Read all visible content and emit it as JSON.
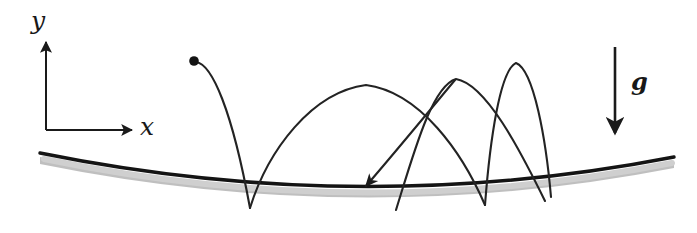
{
  "figure": {
    "background_color": "#ffffff",
    "ink_color": "#1a1a1a",
    "ground_shadow_color": "#b8b8b8"
  },
  "axes": {
    "origin": {
      "x": 46,
      "y": 130
    },
    "y_axis": {
      "label": "y",
      "from": {
        "x": 46,
        "y": 130
      },
      "to": {
        "x": 46,
        "y": 40
      },
      "label_position": {
        "x": 31,
        "y": 8
      },
      "arrow": "up"
    },
    "x_axis": {
      "label": "x",
      "from": {
        "x": 46,
        "y": 130
      },
      "to": {
        "x": 134,
        "y": 130
      },
      "label_position": {
        "x": 140,
        "y": 115
      },
      "arrow": "right"
    }
  },
  "gravity": {
    "label": "g",
    "label_position": {
      "x": 631,
      "y": 70
    },
    "arrow": {
      "from": {
        "x": 615,
        "y": 47
      },
      "to": {
        "x": 615,
        "y": 136
      },
      "direction": "down"
    }
  },
  "ground": {
    "name": "curved-concave-surface",
    "left_end": {
      "x": 40,
      "y": 153
    },
    "right_end": {
      "x": 674,
      "y": 157
    },
    "lowest_point": {
      "x": 380,
      "y": 211
    },
    "line_width": 3.2,
    "shadow_offset": 6
  },
  "ball": {
    "label": "particle",
    "position": {
      "x": 194,
      "y": 61
    },
    "radius": 4.6,
    "color": "#131313"
  },
  "trajectory": {
    "description": "Sequence of projectile arcs connecting bounce points on the concave surface.",
    "bounce_points": [
      {
        "x": 250,
        "y": 208
      },
      {
        "x": 485,
        "y": 205
      },
      {
        "x": 545,
        "y": 201
      }
    ],
    "arc_peaks": [
      {
        "x": 365,
        "y": 84
      },
      {
        "x": 455,
        "y": 78
      },
      {
        "x": 515,
        "y": 62
      }
    ],
    "velocity_arrow": {
      "tip": {
        "x": 362,
        "y": 190
      },
      "direction": "down-left"
    }
  }
}
